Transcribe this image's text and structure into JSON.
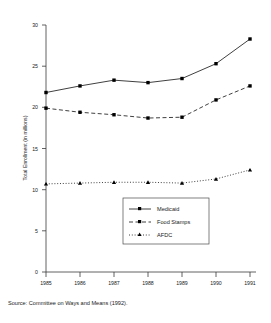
{
  "chart_data": {
    "type": "line",
    "title": "",
    "xlabel": "",
    "ylabel": "Total Enrollment (in millions)",
    "categories": [
      "1985",
      "1986",
      "1987",
      "1988",
      "1989",
      "1990",
      "1991"
    ],
    "x": [
      1985,
      1986,
      1987,
      1988,
      1989,
      1990,
      1991
    ],
    "xlim": [
      1985,
      1991
    ],
    "ylim": [
      0,
      30
    ],
    "yticks": [
      0,
      5,
      10,
      15,
      20,
      25,
      30
    ],
    "ytick_labels": [
      "0",
      "5",
      "10",
      "15",
      "20",
      "25",
      "30"
    ],
    "xtick_labels": [
      "1985",
      "1986",
      "1987",
      "1988",
      "1989",
      "1990",
      "1991"
    ],
    "grid": false,
    "legend_position": "center-right",
    "series": [
      {
        "name": "Medicaid",
        "values": [
          21.8,
          22.6,
          23.3,
          23.0,
          23.5,
          25.3,
          28.3
        ],
        "line_style": "solid",
        "marker": "square",
        "color": "#000000"
      },
      {
        "name": "Food Stamps",
        "values": [
          19.9,
          19.4,
          19.1,
          18.7,
          18.8,
          20.9,
          22.6
        ],
        "line_style": "dashed",
        "marker": "square",
        "color": "#000000"
      },
      {
        "name": "AFDC",
        "values": [
          10.7,
          10.8,
          10.9,
          10.9,
          10.8,
          11.3,
          12.4
        ],
        "line_style": "dotted",
        "marker": "triangle",
        "color": "#000000"
      }
    ],
    "annotations": []
  },
  "axis": {
    "y_title": "Total Enrollment (in millions)",
    "y_ticks": [
      "30",
      "25",
      "20",
      "15",
      "10",
      "5",
      "0"
    ],
    "x_ticks": [
      "1985",
      "1986",
      "1987",
      "1988",
      "1989",
      "1990",
      "1991"
    ]
  },
  "legend": {
    "entries": [
      {
        "label": "Medicaid"
      },
      {
        "label": "Food Stamps"
      },
      {
        "label": "AFDC"
      }
    ]
  },
  "footer": {
    "source": "Source: Committee on Ways and Means (1992)."
  }
}
